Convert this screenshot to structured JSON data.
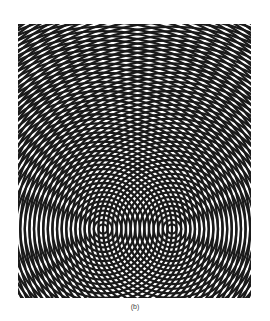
{
  "figure": {
    "sources": [
      {
        "x": 85,
        "y": 205
      },
      {
        "x": 154,
        "y": 205
      }
    ],
    "ring_spacing": 4.6,
    "ring_count": 90,
    "line_color": "#1a1a1a",
    "background": "#ffffff"
  },
  "caption": {
    "label": "(b)"
  }
}
